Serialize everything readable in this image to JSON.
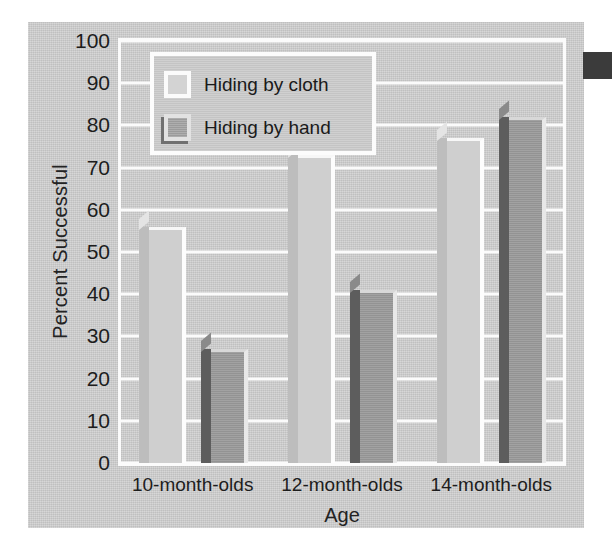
{
  "chart_data": {
    "type": "bar",
    "title": "",
    "xlabel": "Age",
    "ylabel": "Percent Successful",
    "categories": [
      "10-month-olds",
      "12-month-olds",
      "14-month-olds"
    ],
    "series": [
      {
        "name": "Hiding by cloth",
        "values": [
          56,
          73,
          77
        ],
        "color": "#cfcfcf"
      },
      {
        "name": "Hiding by hand",
        "values": [
          27,
          41,
          82
        ],
        "color": "#9b9b9b"
      }
    ],
    "ylim": [
      0,
      100
    ],
    "ytick_step": 10,
    "yticks": [
      100,
      90,
      80,
      70,
      60,
      50,
      40,
      30,
      20,
      10,
      0
    ],
    "ytick_labels": [
      "100",
      "90",
      "80",
      "70",
      "60",
      "50",
      "40",
      "30",
      "20",
      "10",
      "0"
    ],
    "grid": true,
    "grid_color": "#fbfbfb",
    "legend_position": "top-left-inside",
    "background_color": "#cdcdcd",
    "text_color": "#1d1d1d"
  },
  "legend": {
    "entries": [
      {
        "label": "Hiding by cloth",
        "swatch": "cloth-swatch"
      },
      {
        "label": "Hiding by hand",
        "swatch": "hand-swatch"
      }
    ]
  },
  "axes": {
    "y_title": "Percent Successful",
    "x_title": "Age"
  }
}
